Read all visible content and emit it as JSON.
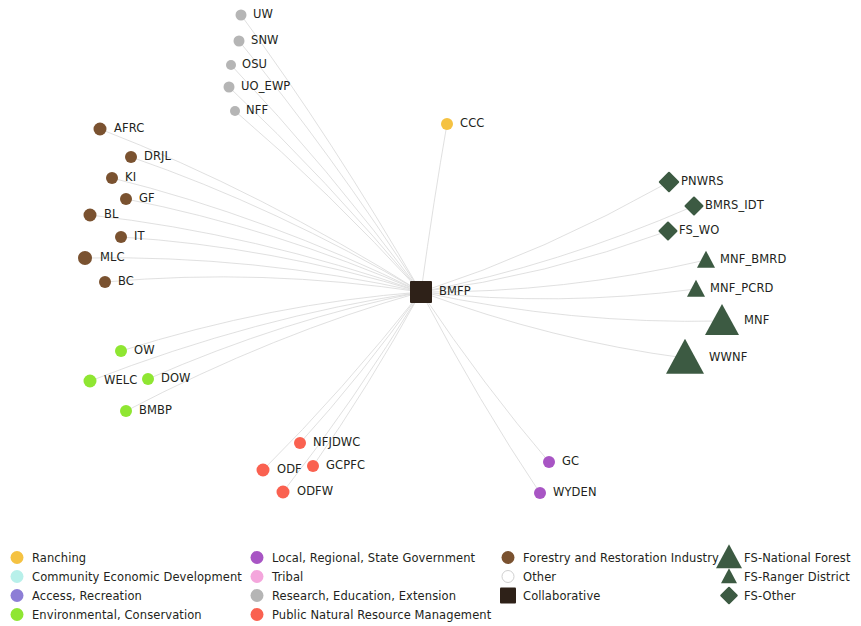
{
  "chart_data": {
    "type": "network",
    "title": "",
    "background": "#ffffff",
    "hub": "BMFP",
    "edge_color": "#d8d8d8",
    "categories": [
      {
        "key": "ranching",
        "label": "Ranching",
        "color": "#f5c242",
        "shape": "circle"
      },
      {
        "key": "ced",
        "label": "Community Economic Development",
        "color": "#b8f0ea",
        "shape": "circle"
      },
      {
        "key": "access",
        "label": "Access, Recreation",
        "color": "#8d7ed6",
        "shape": "circle"
      },
      {
        "key": "environmental",
        "label": "Environmental, Conservation",
        "color": "#8fe632",
        "shape": "circle"
      },
      {
        "key": "government",
        "label": "Local, Regional, State Government",
        "color": "#a855c4",
        "shape": "circle"
      },
      {
        "key": "tribal",
        "label": "Tribal",
        "color": "#f4a6dc",
        "shape": "circle"
      },
      {
        "key": "research",
        "label": "Research, Education, Extension",
        "color": "#b5b5b5",
        "shape": "circle"
      },
      {
        "key": "public",
        "label": "Public Natural Resource Management",
        "color": "#fa6150",
        "shape": "circle"
      },
      {
        "key": "forestry",
        "label": "Forestry and Restoration Industry",
        "color": "#7a5230",
        "shape": "circle"
      },
      {
        "key": "other",
        "label": "Other",
        "color": "#ffffff",
        "shape": "circle-outline"
      },
      {
        "key": "collaborative",
        "label": "Collaborative",
        "color": "#2e2118",
        "shape": "square"
      },
      {
        "key": "fs_national_forest",
        "label": "FS-National Forest",
        "color": "#3c5a42",
        "shape": "triangle-large"
      },
      {
        "key": "fs_ranger_district",
        "label": "FS-Ranger District",
        "color": "#3c5a42",
        "shape": "triangle-small"
      },
      {
        "key": "fs_other",
        "label": "FS-Other",
        "color": "#3c5a42",
        "shape": "diamond"
      }
    ],
    "nodes": [
      {
        "id": "UW",
        "label": "UW",
        "category": "research",
        "x": 241,
        "y": 15,
        "size": 11,
        "label_dx": 12
      },
      {
        "id": "SNW",
        "label": "SNW",
        "category": "research",
        "x": 239,
        "y": 41,
        "size": 11,
        "label_dx": 12
      },
      {
        "id": "OSU",
        "label": "OSU",
        "category": "research",
        "x": 231,
        "y": 65,
        "size": 10,
        "label_dx": 11
      },
      {
        "id": "UO_EWP",
        "label": "UO_EWP",
        "category": "research",
        "x": 229,
        "y": 87,
        "size": 11,
        "label_dx": 12
      },
      {
        "id": "NFF",
        "label": "NFF",
        "category": "research",
        "x": 235,
        "y": 111,
        "size": 10,
        "label_dx": 11
      },
      {
        "id": "CCC",
        "label": "CCC",
        "category": "ranching",
        "x": 447,
        "y": 124,
        "size": 12,
        "label_dx": 13
      },
      {
        "id": "AFRC",
        "label": "AFRC",
        "category": "forestry",
        "x": 100,
        "y": 129,
        "size": 13,
        "label_dx": 14
      },
      {
        "id": "DRJL",
        "label": "DRJL",
        "category": "forestry",
        "x": 131,
        "y": 157,
        "size": 12,
        "label_dx": 13
      },
      {
        "id": "KI",
        "label": "KI",
        "category": "forestry",
        "x": 112,
        "y": 178,
        "size": 12,
        "label_dx": 13
      },
      {
        "id": "GF",
        "label": "GF",
        "category": "forestry",
        "x": 126,
        "y": 199,
        "size": 12,
        "label_dx": 13
      },
      {
        "id": "BL",
        "label": "BL",
        "category": "forestry",
        "x": 90,
        "y": 215,
        "size": 13,
        "label_dx": 14
      },
      {
        "id": "IT",
        "label": "IT",
        "category": "forestry",
        "x": 121,
        "y": 237,
        "size": 12,
        "label_dx": 13
      },
      {
        "id": "MLC",
        "label": "MLC",
        "category": "forestry",
        "x": 85,
        "y": 258,
        "size": 14,
        "label_dx": 15
      },
      {
        "id": "BC",
        "label": "BC",
        "category": "forestry",
        "x": 105,
        "y": 282,
        "size": 12,
        "label_dx": 13
      },
      {
        "id": "OW",
        "label": "OW",
        "category": "environmental",
        "x": 121,
        "y": 351,
        "size": 12,
        "label_dx": 13
      },
      {
        "id": "WELC",
        "label": "WELC",
        "category": "environmental",
        "x": 90,
        "y": 381,
        "size": 13,
        "label_dx": 14
      },
      {
        "id": "DOW",
        "label": "DOW",
        "category": "environmental",
        "x": 148,
        "y": 379,
        "size": 12,
        "label_dx": 13
      },
      {
        "id": "BMBP",
        "label": "BMBP",
        "category": "environmental",
        "x": 126,
        "y": 411,
        "size": 12,
        "label_dx": 13
      },
      {
        "id": "NFJDWC",
        "label": "NFJDWC",
        "category": "public",
        "x": 300,
        "y": 443,
        "size": 12,
        "label_dx": 13
      },
      {
        "id": "ODF",
        "label": "ODF",
        "category": "public",
        "x": 263,
        "y": 470,
        "size": 13,
        "label_dx": 14
      },
      {
        "id": "GCPFC",
        "label": "GCPFC",
        "category": "public",
        "x": 313,
        "y": 466,
        "size": 12,
        "label_dx": 13
      },
      {
        "id": "ODFW",
        "label": "ODFW",
        "category": "public",
        "x": 283,
        "y": 492,
        "size": 13,
        "label_dx": 14
      },
      {
        "id": "GC",
        "label": "GC",
        "category": "government",
        "x": 549,
        "y": 462,
        "size": 12,
        "label_dx": 13
      },
      {
        "id": "WYDEN",
        "label": "WYDEN",
        "category": "government",
        "x": 540,
        "y": 493,
        "size": 12,
        "label_dx": 13
      },
      {
        "id": "PNWRS",
        "label": "PNWRS",
        "category": "fs_other",
        "x": 669,
        "y": 182,
        "size": 15,
        "label_dx": 12
      },
      {
        "id": "BMRS_IDT",
        "label": "BMRS_IDT",
        "category": "fs_other",
        "x": 694,
        "y": 206,
        "size": 14,
        "label_dx": 11
      },
      {
        "id": "FS_WO",
        "label": "FS_WO",
        "category": "fs_other",
        "x": 668,
        "y": 231,
        "size": 14,
        "label_dx": 11
      },
      {
        "id": "MNF_BMRD",
        "label": "MNF_BMRD",
        "category": "fs_ranger_district",
        "x": 706,
        "y": 260,
        "size": 19,
        "label_dx": 14
      },
      {
        "id": "MNF_PCRD",
        "label": "MNF_PCRD",
        "category": "fs_ranger_district",
        "x": 696,
        "y": 289,
        "size": 19,
        "label_dx": 14
      },
      {
        "id": "MNF",
        "label": "MNF",
        "category": "fs_national_forest",
        "x": 722,
        "y": 321,
        "size": 34,
        "label_dx": 22
      },
      {
        "id": "WWNF",
        "label": "WWNF",
        "category": "fs_national_forest",
        "x": 685,
        "y": 358,
        "size": 38,
        "label_dx": 24
      },
      {
        "id": "BMFP",
        "label": "BMFP",
        "category": "collaborative",
        "x": 421,
        "y": 292,
        "size": 22,
        "label_dx": 18
      }
    ],
    "edges_from_hub": [
      "UW",
      "SNW",
      "OSU",
      "UO_EWP",
      "NFF",
      "CCC",
      "AFRC",
      "DRJL",
      "KI",
      "GF",
      "BL",
      "IT",
      "MLC",
      "BC",
      "OW",
      "WELC",
      "DOW",
      "BMBP",
      "NFJDWC",
      "ODF",
      "GCPFC",
      "ODFW",
      "GC",
      "WYDEN",
      "PNWRS",
      "BMRS_IDT",
      "FS_WO",
      "MNF_BMRD",
      "MNF_PCRD",
      "MNF",
      "WWNF"
    ]
  },
  "legend": {
    "columns": [
      {
        "left": 6,
        "rows": [
          {
            "label": "Ranching",
            "category": "ranching"
          },
          {
            "label": "Community Economic Development",
            "category": "ced"
          },
          {
            "label": "Access, Recreation",
            "category": "access"
          },
          {
            "label": "Environmental, Conservation",
            "category": "environmental"
          }
        ]
      },
      {
        "left": 246,
        "rows": [
          {
            "label": "Local, Regional, State Government",
            "category": "government"
          },
          {
            "label": "Tribal",
            "category": "tribal"
          },
          {
            "label": "Research, Education, Extension",
            "category": "research"
          },
          {
            "label": "Public Natural Resource Management",
            "category": "public"
          }
        ]
      },
      {
        "left": 497,
        "rows": [
          {
            "label": "Forestry and Restoration Industry",
            "category": "forestry"
          },
          {
            "label": "Other",
            "category": "other"
          },
          {
            "label": "Collaborative",
            "category": "collaborative"
          }
        ]
      },
      {
        "left": 718,
        "rows": [
          {
            "label": "FS-National Forest",
            "category": "fs_national_forest"
          },
          {
            "label": "FS-Ranger District",
            "category": "fs_ranger_district"
          },
          {
            "label": "FS-Other",
            "category": "fs_other"
          }
        ]
      }
    ]
  }
}
